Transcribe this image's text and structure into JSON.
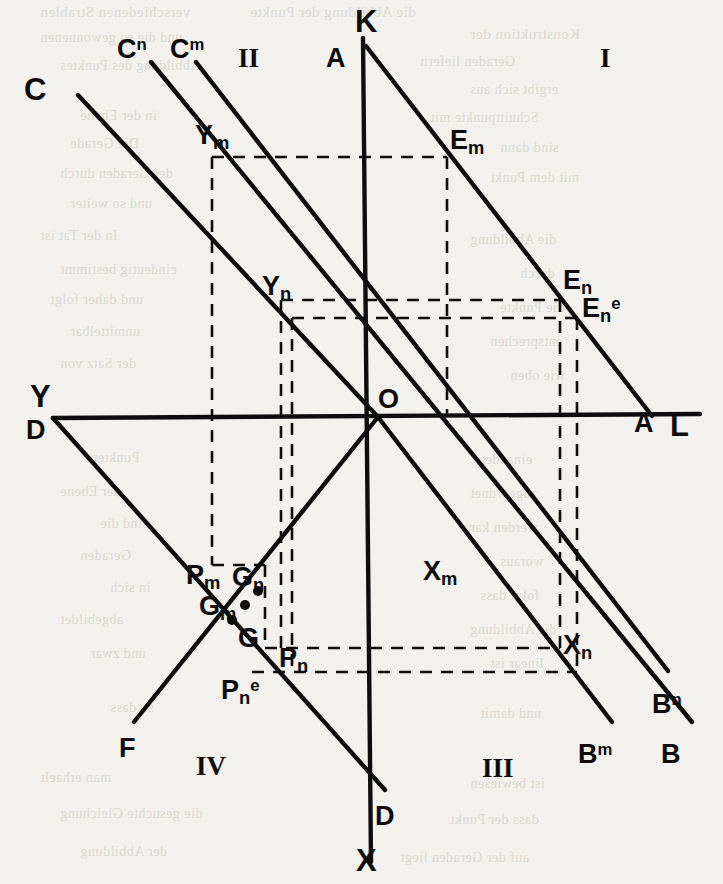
{
  "figure": {
    "kind": "geometric-line-diagram",
    "background_color": "#f2f1ed",
    "ink_color": "#0d0d0d",
    "width": 723,
    "height": 884
  },
  "quadrants": [
    {
      "name": "quadrant-1",
      "label": "I",
      "x": 600,
      "y": 45
    },
    {
      "name": "quadrant-2",
      "label": "II",
      "x": 238,
      "y": 45
    },
    {
      "name": "quadrant-3",
      "label": "III",
      "x": 482,
      "y": 755
    },
    {
      "name": "quadrant-4",
      "label": "IV",
      "x": 196,
      "y": 753
    }
  ],
  "axis_labels": [
    {
      "name": "axis-label-k",
      "text": "K",
      "x": 355,
      "y": 6
    },
    {
      "name": "axis-label-x",
      "text": "X",
      "x": 356,
      "y": 845
    },
    {
      "name": "axis-label-y",
      "text": "Y",
      "x": 30,
      "y": 381
    },
    {
      "name": "axis-label-l",
      "text": "L",
      "x": 670,
      "y": 410
    }
  ],
  "point_labels": [
    {
      "name": "label-a-top",
      "base": "A",
      "sub": "",
      "sup": "",
      "x": 326,
      "y": 45,
      "size": "mid"
    },
    {
      "name": "label-a-right",
      "base": "A",
      "sub": "",
      "sup": "",
      "x": 634,
      "y": 410,
      "size": "mid"
    },
    {
      "name": "label-c",
      "base": "C",
      "sub": "",
      "sup": "",
      "x": 24,
      "y": 74,
      "size": "big"
    },
    {
      "name": "label-c-n",
      "base": "C",
      "sub": "",
      "sup": "n",
      "x": 117,
      "y": 36,
      "size": "mid"
    },
    {
      "name": "label-c-m",
      "base": "C",
      "sub": "",
      "sup": "m",
      "x": 170,
      "y": 36,
      "size": "mid"
    },
    {
      "name": "label-d-left",
      "base": "D",
      "sub": "",
      "sup": "",
      "x": 26,
      "y": 417,
      "size": "mid"
    },
    {
      "name": "label-d-bottom",
      "base": "D",
      "sub": "",
      "sup": "",
      "x": 375,
      "y": 803,
      "size": "mid"
    },
    {
      "name": "label-f",
      "base": "F",
      "sub": "",
      "sup": "",
      "x": 119,
      "y": 735,
      "size": "mid"
    },
    {
      "name": "label-g",
      "base": "G",
      "sub": "",
      "sup": "",
      "x": 238,
      "y": 625,
      "size": "mid"
    },
    {
      "name": "label-g-m",
      "base": "G",
      "sub": "m",
      "sup": "",
      "x": 199,
      "y": 593,
      "size": "mid"
    },
    {
      "name": "label-g-n",
      "base": "G",
      "sub": "n",
      "sup": "",
      "x": 232,
      "y": 564,
      "size": "mid"
    },
    {
      "name": "label-o",
      "base": "O",
      "sub": "",
      "sup": "",
      "x": 378,
      "y": 386,
      "size": "mid"
    },
    {
      "name": "label-y-m",
      "base": "Y",
      "sub": "m",
      "sup": "",
      "x": 195,
      "y": 122,
      "size": "mid"
    },
    {
      "name": "label-y-n",
      "base": "Y",
      "sub": "n",
      "sup": "",
      "x": 262,
      "y": 273,
      "size": "mid"
    },
    {
      "name": "label-x-m",
      "base": "X",
      "sub": "m",
      "sup": "",
      "x": 423,
      "y": 558,
      "size": "mid"
    },
    {
      "name": "label-x-n",
      "base": "X",
      "sub": "n",
      "sup": "",
      "x": 563,
      "y": 632,
      "size": "mid"
    },
    {
      "name": "label-e-m",
      "base": "E",
      "sub": "m",
      "sup": "",
      "x": 450,
      "y": 127,
      "size": "mid"
    },
    {
      "name": "label-e-n",
      "base": "E",
      "sub": "n",
      "sup": "",
      "x": 563,
      "y": 267,
      "size": "mid"
    },
    {
      "name": "label-e-n-e",
      "base": "E",
      "sub": "n",
      "sup": "e",
      "x": 582,
      "y": 295,
      "size": "mid"
    },
    {
      "name": "label-p-m",
      "base": "P",
      "sub": "m",
      "sup": "",
      "x": 186,
      "y": 562,
      "size": "mid"
    },
    {
      "name": "label-p-n",
      "base": "P",
      "sub": "n",
      "sup": "",
      "x": 279,
      "y": 645,
      "size": "mid"
    },
    {
      "name": "label-p-n-e",
      "base": "P",
      "sub": "n",
      "sup": "e",
      "x": 221,
      "y": 677,
      "size": "mid"
    },
    {
      "name": "label-b",
      "base": "B",
      "sub": "",
      "sup": "",
      "x": 661,
      "y": 741,
      "size": "mid"
    },
    {
      "name": "label-b-m",
      "base": "B",
      "sub": "",
      "sup": "m",
      "x": 578,
      "y": 741,
      "size": "mid"
    },
    {
      "name": "label-b-n",
      "base": "B",
      "sub": "",
      "sup": "n",
      "x": 652,
      "y": 691,
      "size": "mid"
    }
  ],
  "solid_lines": [
    {
      "name": "axis-kx",
      "x1": 363,
      "y1": 38,
      "x2": 371,
      "y2": 862,
      "w": 4.4
    },
    {
      "name": "axis-yl",
      "x1": 53,
      "y1": 418,
      "x2": 700,
      "y2": 414,
      "w": 4.4
    },
    {
      "name": "line-ab",
      "x1": 366,
      "y1": 46,
      "x2": 652,
      "y2": 416,
      "w": 4.4
    },
    {
      "name": "line-c-o",
      "x1": 78,
      "y1": 95,
      "x2": 378,
      "y2": 417,
      "w": 4.4
    },
    {
      "name": "line-cn-b",
      "x1": 151,
      "y1": 62,
      "x2": 692,
      "y2": 722,
      "w": 4.4
    },
    {
      "name": "line-cm-bn",
      "x1": 196,
      "y1": 62,
      "x2": 668,
      "y2": 671,
      "w": 4.4
    },
    {
      "name": "line-o-bm",
      "x1": 378,
      "y1": 417,
      "x2": 612,
      "y2": 722,
      "w": 4.4
    },
    {
      "name": "line-d-d",
      "x1": 53,
      "y1": 418,
      "x2": 385,
      "y2": 790,
      "w": 4.4
    },
    {
      "name": "line-f-o",
      "x1": 134,
      "y1": 722,
      "x2": 378,
      "y2": 417,
      "w": 4.4
    }
  ],
  "dashed_paths": [
    {
      "name": "dash-ym-em",
      "d": "M 212 157 L 447 157"
    },
    {
      "name": "dash-em-down",
      "d": "M 447 157 L 447 417"
    },
    {
      "name": "dash-yn-en",
      "d": "M 281 300 L 560 300"
    },
    {
      "name": "dash-yne-ene",
      "d": "M 292 318 L 577 318"
    },
    {
      "name": "dash-en-down",
      "d": "M 560 300 L 560 648"
    },
    {
      "name": "dash-ene-down",
      "d": "M 577 318 L 577 672"
    },
    {
      "name": "dash-ym-down",
      "d": "M 212 157 L 212 565"
    },
    {
      "name": "dash-ym-bottom",
      "d": "M 212 565 L 265 565"
    },
    {
      "name": "dash-yn-down",
      "d": "M 281 300 L 281 648"
    },
    {
      "name": "dash-yne-down",
      "d": "M 292 318 L 292 672"
    },
    {
      "name": "dash-pn-row",
      "d": "M 265 648 L 560 648"
    },
    {
      "name": "dash-pne-row",
      "d": "M 252 672 L 577 672"
    },
    {
      "name": "dash-pm-col",
      "d": "M 265 565 L 265 648"
    }
  ],
  "dots": [
    {
      "name": "dot-g-n",
      "x": 258,
      "y": 591
    },
    {
      "name": "dot-g-m",
      "x": 245,
      "y": 605
    },
    {
      "name": "dot-g",
      "x": 232,
      "y": 620
    }
  ],
  "ghost_text": [
    {
      "text": "verschiedenen Strahlen",
      "x": 40,
      "y": 4,
      "size": 15
    },
    {
      "text": "die Abbildung der Punkte",
      "x": 250,
      "y": 4,
      "size": 15
    },
    {
      "text": "Konstruktion der",
      "x": 470,
      "y": 26,
      "size": 15
    },
    {
      "text": "und die so gewonnenen",
      "x": 40,
      "y": 30,
      "size": 14
    },
    {
      "text": "Geraden liefern",
      "x": 420,
      "y": 54,
      "size": 14
    },
    {
      "text": "Abbildung des Punktes",
      "x": 60,
      "y": 58,
      "size": 14
    },
    {
      "text": "ergibt sich aus",
      "x": 470,
      "y": 82,
      "size": 14
    },
    {
      "text": "in der Ebene",
      "x": 80,
      "y": 108,
      "size": 14
    },
    {
      "text": "Schnittpunkte mit",
      "x": 430,
      "y": 110,
      "size": 14
    },
    {
      "text": "Die Gerade",
      "x": 70,
      "y": 136,
      "size": 14
    },
    {
      "text": "sind dann",
      "x": 500,
      "y": 140,
      "size": 14
    },
    {
      "text": "der Geraden durch",
      "x": 60,
      "y": 166,
      "size": 14
    },
    {
      "text": "mit dem Punkt",
      "x": 490,
      "y": 170,
      "size": 14
    },
    {
      "text": "und so weiter",
      "x": 70,
      "y": 196,
      "size": 14
    },
    {
      "text": "In der Tat ist",
      "x": 40,
      "y": 228,
      "size": 14
    },
    {
      "text": "die Abbildung",
      "x": 470,
      "y": 232,
      "size": 14
    },
    {
      "text": "eindeutig bestimmt",
      "x": 60,
      "y": 262,
      "size": 14
    },
    {
      "text": "durch",
      "x": 520,
      "y": 266,
      "size": 14
    },
    {
      "text": "und daher folgt",
      "x": 50,
      "y": 292,
      "size": 14
    },
    {
      "text": "die Punkte",
      "x": 500,
      "y": 300,
      "size": 14
    },
    {
      "text": "unmittelbar",
      "x": 70,
      "y": 324,
      "size": 14
    },
    {
      "text": "entsprechen",
      "x": 490,
      "y": 334,
      "size": 14
    },
    {
      "text": "der Satz von",
      "x": 60,
      "y": 356,
      "size": 14
    },
    {
      "text": "wie oben",
      "x": 510,
      "y": 368,
      "size": 14
    },
    {
      "text": "Punkten",
      "x": 90,
      "y": 450,
      "size": 14
    },
    {
      "text": "einander",
      "x": 480,
      "y": 452,
      "size": 14
    },
    {
      "text": "der Ebene",
      "x": 60,
      "y": 484,
      "size": 14
    },
    {
      "text": "zugeordnet",
      "x": 470,
      "y": 486,
      "size": 14
    },
    {
      "text": "sind die",
      "x": 100,
      "y": 516,
      "size": 14
    },
    {
      "text": "werden kann",
      "x": 460,
      "y": 520,
      "size": 14
    },
    {
      "text": "Geraden",
      "x": 80,
      "y": 548,
      "size": 14
    },
    {
      "text": "woraus",
      "x": 500,
      "y": 554,
      "size": 14
    },
    {
      "text": "in sich",
      "x": 110,
      "y": 580,
      "size": 14
    },
    {
      "text": "folgt dass",
      "x": 480,
      "y": 588,
      "size": 14
    },
    {
      "text": "abgebildet",
      "x": 60,
      "y": 612,
      "size": 14
    },
    {
      "text": "die Abbildung",
      "x": 470,
      "y": 622,
      "size": 14
    },
    {
      "text": "und zwar",
      "x": 90,
      "y": 646,
      "size": 14
    },
    {
      "text": "linear ist",
      "x": 490,
      "y": 656,
      "size": 14
    },
    {
      "text": "so dass",
      "x": 110,
      "y": 700,
      "size": 14
    },
    {
      "text": "und damit",
      "x": 480,
      "y": 706,
      "size": 14
    },
    {
      "text": "man erhaelt",
      "x": 40,
      "y": 770,
      "size": 14
    },
    {
      "text": "ist bewiesen",
      "x": 470,
      "y": 776,
      "size": 14
    },
    {
      "text": "die gesuchte Gleichung",
      "x": 60,
      "y": 806,
      "size": 14
    },
    {
      "text": "dass der Punkt",
      "x": 450,
      "y": 812,
      "size": 14
    },
    {
      "text": "der Abbildung",
      "x": 80,
      "y": 844,
      "size": 14
    },
    {
      "text": "auf der Geraden liegt",
      "x": 400,
      "y": 850,
      "size": 14
    }
  ]
}
